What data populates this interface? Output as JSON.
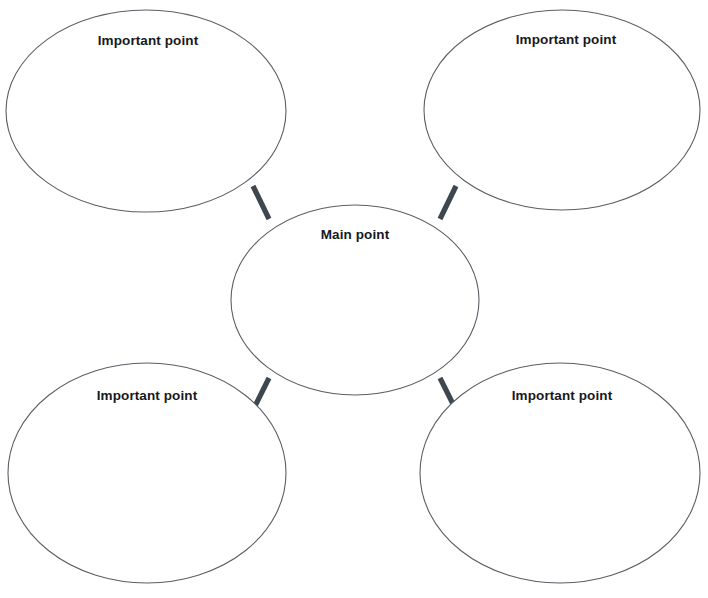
{
  "canvas": {
    "width": 708,
    "height": 598,
    "background": "#ffffff"
  },
  "diagram": {
    "type": "concept-map",
    "ellipse_stroke": "#5a5f66",
    "ellipse_fill": "#ffffff",
    "connector_color": "#3f474e",
    "text_color": "#17191c",
    "center_node": {
      "label": "Main point",
      "cx": 355,
      "cy": 300,
      "rx": 124,
      "ry": 95,
      "label_x": 355,
      "label_y": 235
    },
    "outer_nodes": [
      {
        "id": "top-left",
        "label": "Important point",
        "cx": 146,
        "cy": 111,
        "rx": 140,
        "ry": 101,
        "label_x": 148,
        "label_y": 41
      },
      {
        "id": "top-right",
        "label": "Important point",
        "cx": 562,
        "cy": 110,
        "rx": 138,
        "ry": 100,
        "label_x": 566,
        "label_y": 40
      },
      {
        "id": "bottom-left",
        "label": "Important point",
        "cx": 147,
        "cy": 473,
        "rx": 139,
        "ry": 110,
        "label_x": 147,
        "label_y": 396
      },
      {
        "id": "bottom-right",
        "label": "Important point",
        "cx": 560,
        "cy": 473,
        "rx": 140,
        "ry": 110,
        "label_x": 562,
        "label_y": 396
      }
    ],
    "connectors": [
      {
        "id": "center-to-top-left",
        "x1": 253,
        "y1": 186,
        "x2": 269,
        "y2": 219
      },
      {
        "id": "center-to-top-right",
        "x1": 456,
        "y1": 186,
        "x2": 440,
        "y2": 219
      },
      {
        "id": "center-to-bottom-left",
        "x1": 269,
        "y1": 378,
        "x2": 253,
        "y2": 410
      },
      {
        "id": "center-to-bottom-right",
        "x1": 440,
        "y1": 378,
        "x2": 456,
        "y2": 410
      }
    ]
  }
}
